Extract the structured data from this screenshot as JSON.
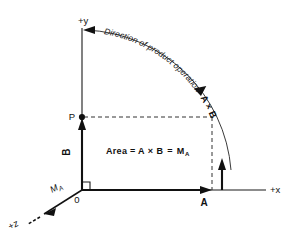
{
  "diagram": {
    "background_color": "#ffffff",
    "line_color": "#111111",
    "axes": {
      "y_label": "+y",
      "x_label": "+x",
      "z_label": "+z",
      "origin_label": "0"
    },
    "points": {
      "p_label": "P"
    },
    "vectors": {
      "a_label": "A",
      "b_label": "B",
      "moment_label": "M",
      "moment_subscript": "A"
    },
    "area_equation": {
      "prefix": "Area  =  ",
      "a": "A",
      "times": "×",
      "b": "B",
      "equals": "=",
      "result": "M",
      "result_subscript": "A",
      "full_text": "Area = A × B = Mₐ"
    },
    "arc_annotation": {
      "line_text": "Direction of product operation",
      "bold_text": "A × B",
      "full_text": "Direction of product operation A × B",
      "characters": [
        "D",
        "i",
        "r",
        "e",
        "c",
        "t",
        "i",
        "o",
        "n",
        " ",
        "o",
        "f",
        " ",
        "p",
        "r",
        "o",
        "d",
        "u",
        "c",
        "t",
        " ",
        "o",
        "p",
        "e",
        "r",
        "a",
        "t",
        "i",
        "o",
        "n"
      ],
      "bold_characters": [
        "A",
        " ",
        "×",
        " ",
        "B"
      ]
    }
  }
}
